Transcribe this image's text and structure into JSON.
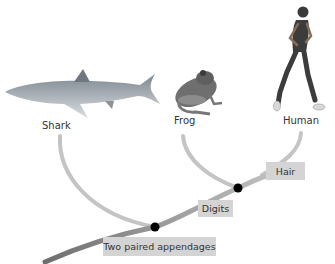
{
  "taxa": [
    {
      "name": "Shark",
      "icon": "shark-icon"
    },
    {
      "name": "Frog",
      "icon": "frog-icon"
    },
    {
      "name": "Human",
      "icon": "human-runner-icon"
    }
  ],
  "characters": [
    {
      "label": "Two paired appendages"
    },
    {
      "label": "Digits"
    },
    {
      "label": "Hair"
    }
  ],
  "colors": {
    "branch": "#c4c4c4",
    "trunk_dark": "#7a7a7a",
    "node": "#000000",
    "label_box": "#d4d4d4"
  }
}
